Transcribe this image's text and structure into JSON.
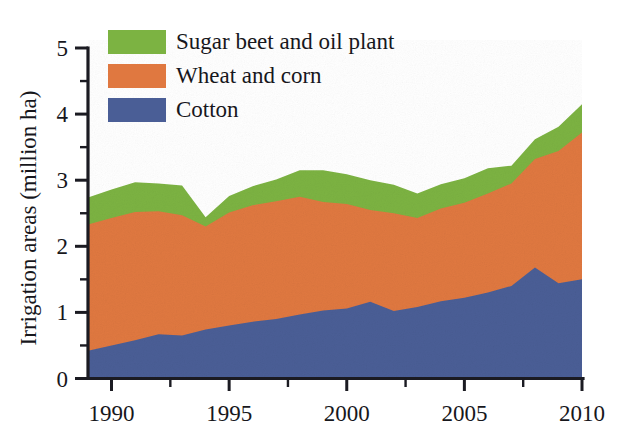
{
  "figure": {
    "background_color": "#ffffff",
    "axis_color": "#1b1b22"
  },
  "chart_data": {
    "type": "area",
    "stacked": true,
    "title": "",
    "xlabel": "",
    "ylabel": "Irrigation areas (million ha)",
    "xlim": [
      1989,
      2010
    ],
    "ylim": [
      0,
      5
    ],
    "grid": false,
    "legend_position": "top-left",
    "x": [
      1989,
      1990,
      1991,
      1992,
      1993,
      1994,
      1995,
      1996,
      1997,
      1998,
      1999,
      2000,
      2001,
      2002,
      2003,
      2004,
      2005,
      2006,
      2007,
      2008,
      2009,
      2010
    ],
    "xticks": [
      1990,
      1995,
      2000,
      2005,
      2010
    ],
    "xtick_labels": [
      "1990",
      "1995",
      "2000",
      "2005",
      "2010"
    ],
    "xminor_ticks": [
      1992.5,
      1997.5,
      2002.5,
      2007.5
    ],
    "yticks": [
      0,
      1,
      2,
      3,
      4,
      5
    ],
    "ytick_labels": [
      "0",
      "1",
      "2",
      "3",
      "4",
      "5"
    ],
    "yminor_ticks": [
      0.5,
      1.5,
      2.5,
      3.5,
      4.5
    ],
    "series": [
      {
        "name": "Cotton",
        "color": "#4a5e96",
        "values": [
          0.42,
          0.5,
          0.58,
          0.67,
          0.65,
          0.74,
          0.8,
          0.86,
          0.9,
          0.97,
          1.03,
          1.06,
          1.16,
          1.02,
          1.08,
          1.17,
          1.22,
          1.3,
          1.4,
          1.68,
          1.44,
          1.5
        ]
      },
      {
        "name": "Wheat and corn",
        "color": "#e07840",
        "values": [
          1.91,
          1.93,
          1.94,
          1.86,
          1.82,
          1.56,
          1.71,
          1.76,
          1.78,
          1.78,
          1.64,
          1.58,
          1.39,
          1.48,
          1.35,
          1.4,
          1.44,
          1.5,
          1.55,
          1.64,
          2.0,
          2.22
        ]
      },
      {
        "name": "Sugar beet and oil plant",
        "color": "#7cb342",
        "values": [
          0.41,
          0.43,
          0.45,
          0.42,
          0.45,
          0.14,
          0.25,
          0.29,
          0.33,
          0.4,
          0.48,
          0.45,
          0.45,
          0.43,
          0.37,
          0.37,
          0.37,
          0.38,
          0.27,
          0.3,
          0.37,
          0.43
        ]
      }
    ],
    "cumulative_tops": {
      "cotton": [
        0.42,
        0.5,
        0.58,
        0.67,
        0.65,
        0.74,
        0.8,
        0.86,
        0.9,
        0.97,
        1.03,
        1.06,
        1.16,
        1.02,
        1.08,
        1.17,
        1.22,
        1.3,
        1.4,
        1.68,
        1.44,
        1.5
      ],
      "cotton_plus_wheat": [
        2.33,
        2.43,
        2.52,
        2.53,
        2.47,
        2.3,
        2.51,
        2.62,
        2.68,
        2.75,
        2.67,
        2.64,
        2.55,
        2.5,
        2.43,
        2.57,
        2.66,
        2.8,
        2.95,
        3.32,
        3.44,
        3.72
      ],
      "total": [
        2.74,
        2.86,
        2.97,
        2.95,
        2.92,
        2.44,
        2.76,
        2.91,
        3.01,
        3.15,
        3.15,
        3.09,
        3.0,
        2.93,
        2.8,
        2.94,
        3.03,
        3.18,
        3.22,
        3.62,
        3.81,
        4.15
      ]
    }
  },
  "legend": {
    "items": [
      {
        "label": "Sugar beet and oil plant",
        "color": "#7cb342",
        "swatch_name": "legend-swatch-sugar-beet"
      },
      {
        "label": "Wheat and corn",
        "color": "#e07840",
        "swatch_name": "legend-swatch-wheat-corn"
      },
      {
        "label": "Cotton",
        "color": "#4a5e96",
        "swatch_name": "legend-swatch-cotton"
      }
    ]
  },
  "axes": {
    "y_title": "Irrigation areas (million ha)",
    "y_tick_labels": [
      "5",
      "4",
      "3",
      "2",
      "1",
      "0"
    ],
    "x_tick_labels": [
      "1990",
      "1995",
      "2000",
      "2005",
      "2010"
    ]
  }
}
